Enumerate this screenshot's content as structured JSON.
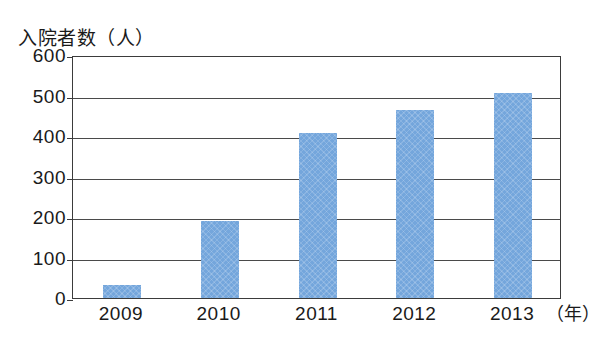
{
  "chart_data": {
    "type": "bar",
    "title": "",
    "ylabel": "入院者数（人）",
    "xlabel": "（年）",
    "categories": [
      "2009",
      "2010",
      "2011",
      "2012",
      "2013"
    ],
    "values": [
      33,
      190,
      407,
      465,
      505
    ],
    "ylim": [
      0,
      600
    ],
    "yticks": [
      0,
      100,
      200,
      300,
      400,
      500,
      600
    ],
    "ytick_labels": [
      "0",
      "100",
      "200",
      "300",
      "400",
      "500",
      "600"
    ],
    "grid": true,
    "legend": null,
    "series": [
      {
        "name": "入院者数",
        "values": [
          33,
          190,
          407,
          465,
          505
        ],
        "color": "#74a6dc"
      }
    ],
    "colors": {
      "bar": "#74a6dc",
      "axis": "#3b3b3b",
      "gridline": "#4a4a4a",
      "text": "#1a1a1a",
      "background": "#ffffff"
    }
  }
}
